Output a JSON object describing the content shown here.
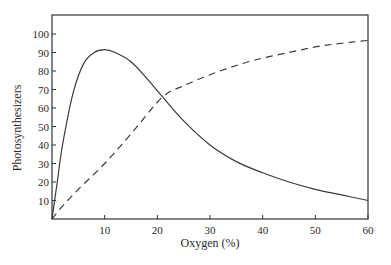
{
  "chart_data": {
    "type": "line",
    "title": "",
    "xlabel": "Oxygen (%)",
    "ylabel": "Photosynthesizers",
    "xlim": [
      0,
      60
    ],
    "ylim": [
      0,
      100
    ],
    "x_ticks": [
      10,
      20,
      30,
      40,
      50,
      60
    ],
    "y_ticks": [
      10,
      20,
      30,
      40,
      50,
      60,
      70,
      80,
      90,
      100
    ],
    "grid": false,
    "legend": null,
    "series": [
      {
        "name": "solid curve",
        "style": "solid",
        "x": [
          0,
          1,
          2,
          4,
          6,
          8,
          10,
          12,
          15,
          18,
          21,
          25,
          30,
          35,
          40,
          45,
          50,
          55,
          60
        ],
        "values": [
          0,
          20,
          40,
          68,
          84,
          90,
          91.5,
          90,
          85,
          76,
          66,
          53,
          40,
          31,
          25,
          20,
          16,
          13,
          10
        ]
      },
      {
        "name": "dashed curve",
        "style": "dashed",
        "x": [
          0,
          2,
          5,
          10,
          15,
          21,
          25,
          30,
          35,
          40,
          45,
          50,
          55,
          60
        ],
        "values": [
          0,
          7,
          16,
          30,
          46,
          66,
          72,
          78,
          83,
          87,
          90,
          93,
          95,
          96.5
        ]
      }
    ]
  }
}
